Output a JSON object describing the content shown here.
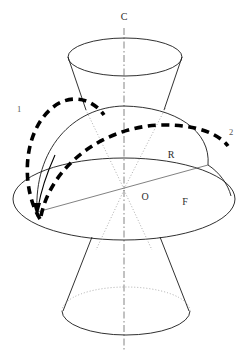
{
  "figure": {
    "background_color": "#ffffff",
    "line_color": "#1a1a1a",
    "accent_color": "#000000",
    "axis_color": "#777777"
  },
  "labels": {
    "axis_top": "C",
    "curve_one": "1",
    "curve_two": "2",
    "dome_region": "R",
    "center_point": "O",
    "disk_region": "F"
  },
  "geometry": {
    "axis": {
      "x": 124,
      "y_top": 28,
      "y_bottom": 352
    },
    "upper_cone": {
      "top_ellipse": {
        "cx": 125,
        "cy": 57,
        "rx": 57,
        "ry": 19
      },
      "apex_left_x": 86,
      "apex_right_x": 164,
      "apex_y": 109
    },
    "dome": {
      "cx": 124,
      "cy": 190,
      "rx": 88,
      "ry": 84,
      "left_base_x": 37,
      "left_base_y": 212,
      "right_base_x": 208,
      "right_base_y": 165
    },
    "disk_ellipse": {
      "cx": 124,
      "cy": 199,
      "rx": 111,
      "ry": 41
    },
    "tilt_line": {
      "x1": 37,
      "y1": 212,
      "x2": 208,
      "y2": 165
    },
    "lower_cone": {
      "bottom_ellipse": {
        "cx": 126,
        "cy": 311,
        "rx": 64,
        "ry": 24
      },
      "top_left_x": 92,
      "top_right_x": 160,
      "top_y": 237
    },
    "radial_dotted": [
      {
        "x1": 124,
        "y1": 189,
        "x2": 84,
        "y2": 108
      },
      {
        "x1": 124,
        "y1": 189,
        "x2": 166,
        "y2": 107
      }
    ]
  },
  "label_positions": {
    "axis_top": {
      "x": 124,
      "y": 18
    },
    "curve_one": {
      "x": 19,
      "y": 110
    },
    "curve_two": {
      "x": 231,
      "y": 133
    },
    "dome_region": {
      "x": 171,
      "y": 156
    },
    "center_point": {
      "x": 145,
      "y": 198
    },
    "disk_region": {
      "x": 185,
      "y": 203
    }
  }
}
